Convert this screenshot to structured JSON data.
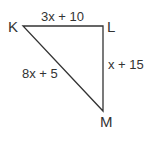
{
  "diagram": {
    "type": "triangle",
    "vertices": {
      "K": {
        "label": "K",
        "x": 23,
        "y": 26
      },
      "L": {
        "label": "L",
        "x": 103,
        "y": 26
      },
      "M": {
        "label": "M",
        "x": 103,
        "y": 111
      }
    },
    "sides": {
      "KL": {
        "label": "3x + 10"
      },
      "LM": {
        "label": "x + 15"
      },
      "KM": {
        "label": "8x + 5"
      }
    },
    "stroke_color": "#333333"
  }
}
